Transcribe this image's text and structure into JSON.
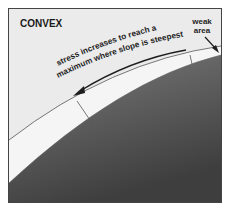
{
  "diagram": {
    "title": "CONVEX",
    "annotation_line1": "stress increases to reach a",
    "annotation_line2": "maximum where slope is steepest",
    "weak_area_label_line1": "weak",
    "weak_area_label_line2": "area",
    "arrow_direction": "downslope (left)",
    "layers": [
      {
        "name": "background",
        "color": "#ebebeb"
      },
      {
        "name": "surface-layer",
        "color": "#f4f4f4"
      },
      {
        "name": "ground",
        "color_top": "#7a7a7a",
        "color_bottom": "#3c3c3c"
      }
    ],
    "colors": {
      "frame_border": "#444444",
      "line": "#555555",
      "text": "#1e1e1e"
    }
  }
}
